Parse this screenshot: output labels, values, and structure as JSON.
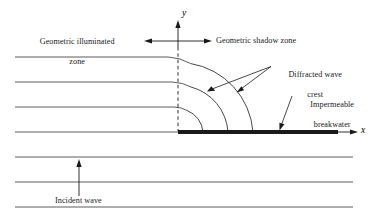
{
  "figure": {
    "title_implicit": "Wave diffraction at an impermeable breakwater",
    "colors": {
      "wave_line": "#4a4a4a",
      "breakwater": "#1a1a1a",
      "axis": "#1a1a1a",
      "text": "#1a1a1a",
      "background": "#ffffff"
    },
    "axes": {
      "x_label": "x",
      "y_label": "y",
      "origin": {
        "x": 178,
        "y": 132
      }
    },
    "labels": {
      "illuminated_zone_line1": "Geometric illuminated",
      "illuminated_zone_line2": "zone",
      "shadow_zone": "Geometric shadow zone",
      "diffracted_crest_line1": "Diffracted wave",
      "diffracted_crest_line2": "crest",
      "breakwater_line1": "Impermeable",
      "breakwater_line2": "breakwater",
      "incident_wave": "Incident wave"
    },
    "elements": {
      "wave_crest_count": 7,
      "wave_crest_spacing_px": 25,
      "diffracted_arc_radii": [
        25,
        50,
        75
      ],
      "breakwater_start_x": 178,
      "breakwater_end_x": 338,
      "breakwater_thickness_px": 4
    }
  }
}
